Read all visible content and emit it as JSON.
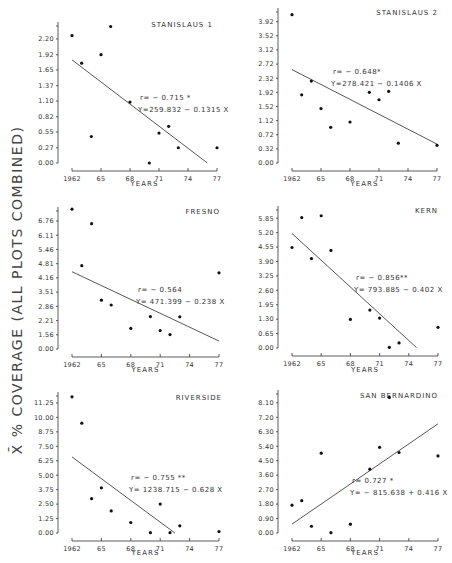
{
  "figure": {
    "ylabel": "X̄ % COVERAGE (ALL PLOTS COMBINED)"
  },
  "chart_data": [
    {
      "type": "scatter",
      "title": "STANISLAUS 1",
      "xlabel": "YEARS",
      "ylabel": "X̄ % COVERAGE (ALL PLOTS COMBINED)",
      "xticks": [
        "1962",
        "65",
        "68",
        "71",
        "74",
        "77"
      ],
      "yticks": [
        "0.00",
        "0.27",
        "0.55",
        "0.82",
        "1.10",
        "1.37",
        "1.65",
        "1.92",
        "2.20"
      ],
      "xlim": [
        1962,
        1977
      ],
      "ylim": [
        0,
        2.5
      ],
      "x": [
        1962,
        1963,
        1964,
        1965,
        1966,
        1968,
        1970,
        1971,
        1972,
        1973,
        1977
      ],
      "y": [
        2.26,
        1.77,
        0.47,
        1.92,
        2.42,
        1.08,
        0.0,
        0.53,
        0.65,
        0.27,
        0.27
      ],
      "regression": {
        "intercept": 259.832,
        "slope": -0.1315,
        "x_range": [
          1962,
          1976
        ]
      },
      "annotation": {
        "r": "r= − 0.715 *",
        "equation": "Y=259.832 − 0.1315 X"
      }
    },
    {
      "type": "scatter",
      "title": "STANISLAUS 2",
      "xlabel": "YEARS",
      "ylabel": "X̄ % COVERAGE (ALL PLOTS COMBINED)",
      "xticks": [
        "1962",
        "65",
        "68",
        "71",
        "74",
        "77"
      ],
      "yticks": [
        "0.00",
        "0.32",
        "0.72",
        "1.12",
        "1.52",
        "1.92",
        "2.32",
        "2.72",
        "3.12",
        "3.52",
        "3.92"
      ],
      "xlim": [
        1962,
        1977
      ],
      "ylim": [
        0,
        4.3
      ],
      "x": [
        1962,
        1963,
        1964,
        1965,
        1966,
        1968,
        1970,
        1971,
        1972,
        1973,
        1977
      ],
      "y": [
        4.12,
        1.85,
        2.24,
        1.46,
        0.93,
        1.08,
        1.92,
        1.71,
        1.95,
        0.48,
        0.42
      ],
      "regression": {
        "intercept": 278.421,
        "slope": -0.1406,
        "x_range": [
          1962,
          1977
        ]
      },
      "annotation": {
        "r": "r= − 0.648*",
        "equation": "Y=278.421 − 0.1406 X"
      }
    },
    {
      "type": "scatter",
      "title": "FRESNO",
      "xlabel": "YEARS",
      "ylabel": "X̄ % COVERAGE (ALL PLOTS COMBINED)",
      "xticks": [
        "1962",
        "65",
        "68",
        "71",
        "74",
        "77"
      ],
      "yticks": [
        "0.00",
        "1.56",
        "2.21",
        "2.86",
        "3.51",
        "4.16",
        "4.81",
        "5.46",
        "6.11",
        "6.76"
      ],
      "xlim": [
        1962,
        1977
      ],
      "ylim": [
        0,
        7.5
      ],
      "x": [
        1962,
        1963,
        1964,
        1965,
        1966,
        1968,
        1970,
        1971,
        1972,
        1973,
        1977
      ],
      "y": [
        7.3,
        4.72,
        6.64,
        3.14,
        2.92,
        1.85,
        2.39,
        1.75,
        1.57,
        2.38,
        4.39
      ],
      "regression": {
        "intercept": 471.399,
        "slope": -0.238,
        "x_range": [
          1962,
          1977
        ]
      },
      "annotation": {
        "r": "r= − 0.564",
        "equation": "Y= 471.399 − 0.238 X"
      }
    },
    {
      "type": "scatter",
      "title": "KERN",
      "xlabel": "YEARS",
      "ylabel": "X̄ % COVERAGE (ALL PLOTS COMBINED)",
      "xticks": [
        "1962",
        "65",
        "68",
        "71",
        "74",
        "77"
      ],
      "yticks": [
        "0.00",
        "0.65",
        "1.30",
        "1.95",
        "2.60",
        "3.25",
        "3.90",
        "4.55",
        "5.20",
        "5.85"
      ],
      "xlim": [
        1962,
        1977
      ],
      "ylim": [
        0,
        6.4
      ],
      "x": [
        1962,
        1963,
        1964,
        1965,
        1966,
        1968,
        1970,
        1971,
        1972,
        1973,
        1977
      ],
      "y": [
        4.53,
        5.88,
        4.03,
        5.96,
        4.4,
        1.29,
        1.71,
        1.35,
        0.03,
        0.23,
        0.93
      ],
      "regression": {
        "intercept": 793.885,
        "slope": -0.402,
        "x_range": [
          1962,
          1974.8
        ]
      },
      "annotation": {
        "r": "r= − 0.856**",
        "equation": "Y= 793.885 − 0.402 X"
      }
    },
    {
      "type": "scatter",
      "title": "RIVERSIDE",
      "xlabel": "YEARS",
      "ylabel": "X̄ % COVERAGE (ALL PLOTS COMBINED)",
      "xticks": [
        "1962",
        "65",
        "68",
        "71",
        "74",
        "77"
      ],
      "yticks": [
        "0.00",
        "1.25",
        "2.50",
        "3.75",
        "5.00",
        "6.25",
        "7.50",
        "8.75",
        "10.00",
        "11.25"
      ],
      "xlim": [
        1962,
        1977
      ],
      "ylim": [
        0,
        12.2
      ],
      "x": [
        1962,
        1963,
        1964,
        1965,
        1966,
        1968,
        1970,
        1971,
        1972,
        1973,
        1977
      ],
      "y": [
        11.78,
        9.5,
        2.97,
        3.91,
        1.91,
        0.91,
        0.03,
        2.5,
        0.03,
        0.62,
        0.12
      ],
      "regression": {
        "intercept": 1238.715,
        "slope": -0.628,
        "x_range": [
          1962,
          1972.5
        ]
      },
      "annotation": {
        "r": "r= − 0.755 **",
        "equation": "Y= 1238.715 − 0.628 X"
      }
    },
    {
      "type": "scatter",
      "title": "SAN BERNARDINO",
      "xlabel": "YEARS",
      "ylabel": "X̄ % COVERAGE (ALL PLOTS COMBINED)",
      "xticks": [
        "1962",
        "65",
        "68",
        "71",
        "74",
        "77"
      ],
      "yticks": [
        "0.00",
        "0.90",
        "1.80",
        "2.70",
        "3.60",
        "4.50",
        "5.40",
        "6.30",
        "7.20",
        "8.10"
      ],
      "xlim": [
        1962,
        1977
      ],
      "ylim": [
        0,
        8.9
      ],
      "x": [
        1962,
        1963,
        1964,
        1965,
        1966,
        1968,
        1970,
        1971,
        1972,
        1973,
        1977
      ],
      "y": [
        1.73,
        2.01,
        0.42,
        4.97,
        0.02,
        0.55,
        3.97,
        5.33,
        8.44,
        5.01,
        4.8
      ],
      "regression": {
        "intercept": -815.638,
        "slope": 0.416,
        "x_range": [
          1962,
          1977
        ]
      },
      "annotation": {
        "r": "r= 0.727 *",
        "equation": "Y= − 815.638 + 0.416 X"
      }
    }
  ]
}
